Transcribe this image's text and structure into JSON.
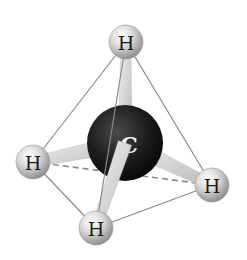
{
  "diagram": {
    "colors": {
      "background": "#ffffff",
      "edge": "#8a8a8a",
      "hidden_edge": "#8a8a8a",
      "bond": "#d6d6d6",
      "hydrogen": "#c8c8c8",
      "carbon": "#1c1c1c"
    },
    "carbon": {
      "label": "C",
      "x": 125,
      "y": 143,
      "r": 38
    },
    "hydrogens": [
      {
        "id": "top",
        "label": "H",
        "x": 126,
        "y": 42,
        "r": 17
      },
      {
        "id": "left",
        "label": "H",
        "x": 33,
        "y": 162,
        "r": 17
      },
      {
        "id": "right",
        "label": "H",
        "x": 212,
        "y": 185,
        "r": 17
      },
      {
        "id": "bottom",
        "label": "H",
        "x": 96,
        "y": 228,
        "r": 17
      }
    ],
    "edges": [
      {
        "from": "top",
        "to": "left",
        "hidden": false
      },
      {
        "from": "top",
        "to": "right",
        "hidden": false
      },
      {
        "from": "top",
        "to": "bottom",
        "hidden": false
      },
      {
        "from": "left",
        "to": "bottom",
        "hidden": false
      },
      {
        "from": "bottom",
        "to": "right",
        "hidden": false
      },
      {
        "from": "left",
        "to": "right",
        "hidden": true
      }
    ]
  }
}
